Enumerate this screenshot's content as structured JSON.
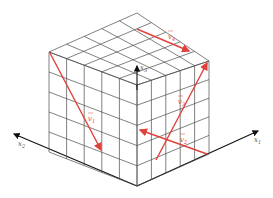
{
  "diagram": {
    "type": "isometric-cube-grid",
    "grid_divisions": 5,
    "colors": {
      "vector": "#e2403a",
      "grid": "#4a4a4a",
      "axis": "#111111",
      "background": "#ffffff"
    },
    "axes": [
      {
        "id": "x1",
        "label": "x",
        "sub": "1"
      },
      {
        "id": "x2",
        "label": "x",
        "sub": "2"
      },
      {
        "id": "x3",
        "label": "x",
        "sub": "3"
      }
    ],
    "vectors": [
      {
        "id": "v1",
        "label": "v",
        "sub": "1",
        "face": "left"
      },
      {
        "id": "v2",
        "label": "v",
        "sub": "2",
        "face": "right"
      },
      {
        "id": "v3",
        "label": "v",
        "sub": "3",
        "face": "right"
      },
      {
        "id": "v4",
        "label": "v",
        "sub": "4",
        "face": "top"
      }
    ]
  }
}
